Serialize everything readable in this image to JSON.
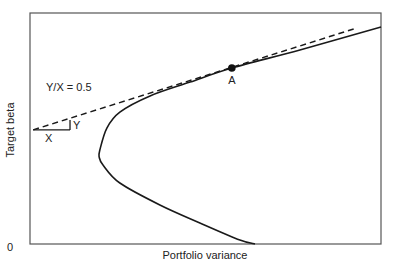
{
  "chart_data": {
    "type": "line",
    "title": "",
    "xlabel": "Portfolio variance",
    "ylabel": "Target beta",
    "xlim": [
      0,
      1
    ],
    "ylim": [
      0,
      1
    ],
    "y_tick_labels": [
      "0"
    ],
    "grid": false,
    "legend": null,
    "series": [
      {
        "name": "frontier",
        "style": "solid",
        "points": [
          [
            0.641,
            0.0
          ],
          [
            0.598,
            0.017
          ],
          [
            0.484,
            0.091
          ],
          [
            0.37,
            0.169
          ],
          [
            0.256,
            0.264
          ],
          [
            0.208,
            0.342
          ],
          [
            0.197,
            0.377
          ],
          [
            0.199,
            0.407
          ],
          [
            0.219,
            0.502
          ],
          [
            0.256,
            0.571
          ],
          [
            0.342,
            0.641
          ],
          [
            0.456,
            0.701
          ],
          [
            0.575,
            0.762
          ],
          [
            0.769,
            0.84
          ],
          [
            1.0,
            0.939
          ]
        ]
      },
      {
        "name": "tangent",
        "style": "dashed",
        "points": [
          [
            0.009,
            0.494
          ],
          [
            0.923,
            0.931
          ]
        ]
      }
    ],
    "slope_triangle": {
      "origin": [
        0.009,
        0.494
      ],
      "run_end_x": 0.114,
      "rise_end_y": 0.537,
      "x_label": "X",
      "y_label": "Y"
    },
    "annotations": [
      {
        "text": "Y/X = 0.5",
        "role": "slope-label"
      },
      {
        "text": "A",
        "role": "tangent-point",
        "point": [
          0.575,
          0.762
        ]
      }
    ]
  }
}
